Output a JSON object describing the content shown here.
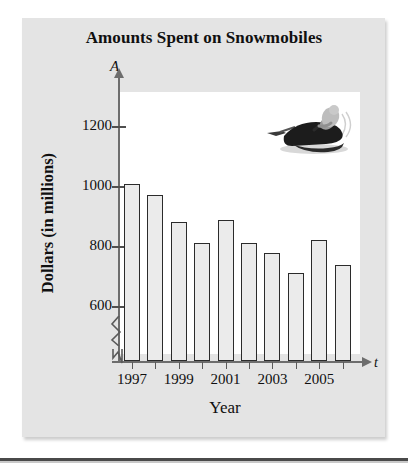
{
  "chart_data": {
    "type": "bar",
    "title": "Amounts Spent on Snowmobiles",
    "xlabel": "Year",
    "ylabel": "Dollars (in millions)",
    "x_axis_variable": "t",
    "y_axis_variable": "A",
    "categories": [
      1997,
      1998,
      1999,
      2000,
      2001,
      2002,
      2003,
      2004,
      2005,
      2006
    ],
    "values": [
      1010,
      975,
      885,
      815,
      890,
      815,
      780,
      712,
      825,
      740
    ],
    "ytick_labels": [
      "600",
      "800",
      "1000",
      "1200"
    ],
    "ytick_values": [
      600,
      800,
      1000,
      1200
    ],
    "ylim": [
      520,
      1280
    ],
    "y_axis_broken": true,
    "xtick_labels": [
      "1997",
      "1999",
      "2001",
      "2003",
      "2005"
    ],
    "xtick_values": [
      1997,
      1999,
      2001,
      2003,
      2005
    ],
    "grid": false,
    "legend": "none",
    "bar_fill_color": "#ebebeb",
    "bar_edge_color": "#2b2b2b",
    "plot_background": "#ffffff",
    "card_background": "#e4e4e4",
    "inset_image": "snowmobile-photo"
  },
  "figure": {
    "title": "Amounts Spent on Snowmobiles",
    "y_axis_title": "Dollars (in millions)",
    "x_axis_title": "Year",
    "y_axis_symbol": "A",
    "x_axis_symbol": "t"
  }
}
